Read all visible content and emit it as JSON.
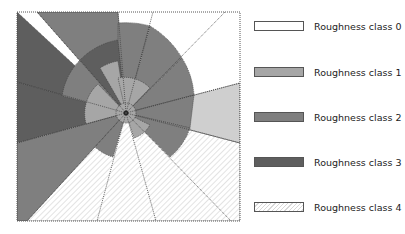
{
  "diagram": {
    "title": "",
    "center": {
      "x": 126,
      "y": 113
    },
    "frame": {
      "x": 17,
      "y": 12,
      "width": 223,
      "height": 209
    }
  },
  "legend": {
    "items": [
      {
        "label": "Roughness class 0",
        "class": 0,
        "color": "#ffffff",
        "pattern": "solid"
      },
      {
        "label": "Roughness class 1",
        "class": 1,
        "color": "#a6a6a6",
        "pattern": "solid"
      },
      {
        "label": "Roughness class 2",
        "class": 2,
        "color": "#7f7f7f",
        "pattern": "solid"
      },
      {
        "label": "Roughness class 3",
        "class": 3,
        "color": "#5e5e5e",
        "pattern": "solid"
      },
      {
        "label": "Roughness class 4",
        "class": 4,
        "color": "#ffffff",
        "pattern": "hatched"
      }
    ]
  },
  "colors": {
    "class0": "#ffffff",
    "class1": "#a6a6a6",
    "class2": "#7f7f7f",
    "class3": "#5e5e5e",
    "class4_bg": "#ffffff",
    "class4_hatch": "#d0d0d0",
    "class_light": "#cfcfcf",
    "border": "#444444"
  }
}
